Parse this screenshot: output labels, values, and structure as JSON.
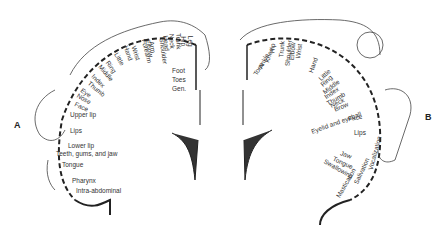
{
  "panels": {
    "A": {
      "letter": "A",
      "type": "sensory",
      "labels_radial": [
        "Little",
        "Ring",
        "Middle",
        "Index",
        "Thumb",
        "Eye",
        "Nose",
        "Face",
        "Hand",
        "Wrist",
        "Forearm",
        "Elbow",
        "Arm",
        "Shoulder",
        "Head",
        "Neck",
        "Trunk",
        "Hip",
        "Leg"
      ],
      "labels_side": [
        "Foot",
        "Toes",
        "Gen."
      ],
      "labels_lower": [
        "Upper lip",
        "Lips",
        "Lower lip",
        "Teeth, gums, and jaw",
        "Tongue",
        "Pharynx",
        "Intra-abdominal"
      ]
    },
    "B": {
      "letter": "B",
      "type": "motor",
      "labels_radial": [
        "Toes",
        "Ankle",
        "Knee",
        "Hip",
        "Trunk",
        "Shoulder",
        "Elbow",
        "Wrist",
        "Hand",
        "Little",
        "Ring",
        "Middle",
        "Index",
        "Thumb",
        "Neck",
        "Brow",
        "Eyelid and eyeball",
        "Face"
      ],
      "labels_lower": [
        "Lips",
        "Jaw",
        "Tongue",
        "Swallowing",
        "Mastication",
        "Salivation",
        "Vocalization"
      ]
    }
  }
}
